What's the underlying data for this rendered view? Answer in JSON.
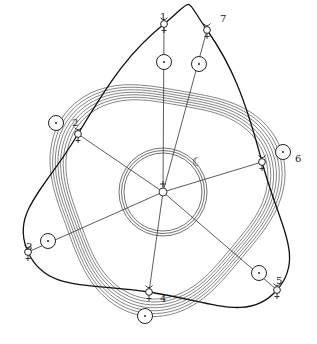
{
  "diagram": {
    "title": "",
    "colors": {
      "ink": "#222222",
      "background": "#ffffff"
    },
    "center": {
      "x": 163,
      "y": 192,
      "symbol": "+"
    },
    "earth_orbit": {
      "radius": 44,
      "moon_symbol": "☾"
    },
    "sun_band": {
      "inner_radius": 98,
      "outer_radius": 114,
      "lines": 7
    },
    "positions": [
      {
        "label": "1",
        "sun": {
          "x": 164,
          "y": 62
        },
        "mercury": {
          "x": 164,
          "y": 24
        },
        "label_pos": {
          "x": 160,
          "y": 12
        }
      },
      {
        "label": "2",
        "sun": {
          "x": 56,
          "y": 123
        },
        "mercury": {
          "x": 78,
          "y": 134
        },
        "label_pos": {
          "x": 72,
          "y": 118
        }
      },
      {
        "label": "3",
        "sun": {
          "x": 48,
          "y": 241
        },
        "mercury": {
          "x": 28,
          "y": 252
        },
        "label_pos": {
          "x": 26,
          "y": 242
        }
      },
      {
        "label": "4",
        "sun": {
          "x": 145,
          "y": 316
        },
        "mercury": {
          "x": 149,
          "y": 292
        },
        "label_pos": {
          "x": 160,
          "y": 294
        }
      },
      {
        "label": "5",
        "sun": {
          "x": 259,
          "y": 273
        },
        "mercury": {
          "x": 277,
          "y": 290
        },
        "label_pos": {
          "x": 276,
          "y": 276
        }
      },
      {
        "label": "6",
        "sun": {
          "x": 283,
          "y": 152
        },
        "mercury": {
          "x": 262,
          "y": 162
        },
        "label_pos": {
          "x": 295,
          "y": 154
        }
      },
      {
        "label": "7",
        "sun": {
          "x": 199,
          "y": 64
        },
        "mercury": {
          "x": 207,
          "y": 30
        },
        "label_pos": {
          "x": 220,
          "y": 14
        }
      }
    ],
    "mercury_symbol": "☿",
    "sun_symbol": "☉"
  }
}
